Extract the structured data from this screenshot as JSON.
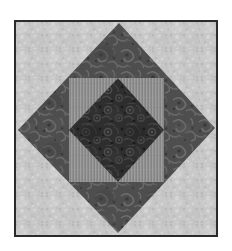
{
  "page": {
    "background_color": "#ffffff",
    "width": 232,
    "height": 251,
    "caption": ""
  },
  "block": {
    "title": "Square in a Square quilt block",
    "border_color": "#2b2b2b",
    "border_width": 2,
    "bounds": {
      "x": 14,
      "y": 20,
      "width": 204,
      "height": 217
    }
  },
  "patches": {
    "background": {
      "name": "corner background triangles",
      "fabric": "light gray mottled print",
      "color": "#c8c8c8",
      "speckle_color": "#b0b0b0",
      "highlight_color": "#dcdcdc"
    },
    "outer_diamond": {
      "name": "outer diamond",
      "fabric": "medium gray swirl paisley print",
      "color": "#4e4e4e",
      "swirl_light": "#6a6a6a",
      "swirl_dark": "#3a3a3a",
      "points": [
        {
          "x": 105,
          "y": 3
        },
        {
          "x": 201,
          "y": 108
        },
        {
          "x": 104,
          "y": 213
        },
        {
          "x": 4,
          "y": 110
        }
      ]
    },
    "inner_square": {
      "name": "inner square frame",
      "fabric": "mid gray fine vertical stripe",
      "color": "#8e8e8e",
      "stripe_color": "#9c9c9c",
      "bounds": {
        "x": 55,
        "y": 58,
        "width": 95,
        "height": 104
      }
    },
    "center_diamond": {
      "name": "center diamond",
      "fabric": "near-black dense floral print",
      "color": "#2e2e2e",
      "floral_light": "#474747",
      "floral_dark": "#1c1c1c",
      "points": [
        {
          "x": 104,
          "y": 58
        },
        {
          "x": 150,
          "y": 110
        },
        {
          "x": 104,
          "y": 162
        },
        {
          "x": 55,
          "y": 110
        }
      ]
    }
  }
}
